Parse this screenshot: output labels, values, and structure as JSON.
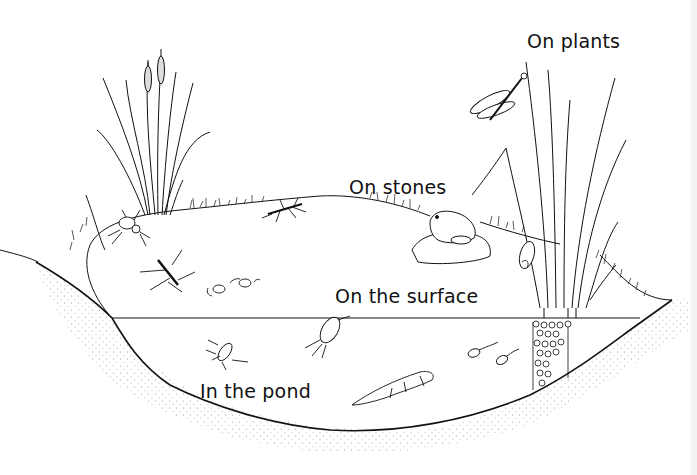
{
  "diagram": {
    "labels": [
      {
        "id": "on-plants",
        "text": "On plants",
        "x": 527,
        "y": 30
      },
      {
        "id": "on-stones",
        "text": "On stones",
        "x": 349,
        "y": 176
      },
      {
        "id": "on-the-surface",
        "text": "On the surface",
        "x": 335,
        "y": 285
      },
      {
        "id": "in-the-pond",
        "text": "In the pond",
        "x": 200,
        "y": 380
      }
    ],
    "organisms": [
      {
        "name": "bulrush",
        "habitat": "bank"
      },
      {
        "name": "reed",
        "habitat": "on-plants"
      },
      {
        "name": "damselfly",
        "habitat": "on-plants"
      },
      {
        "name": "snail",
        "habitat": "on-plants"
      },
      {
        "name": "frog",
        "habitat": "on-stones"
      },
      {
        "name": "pond-skater",
        "habitat": "on-the-surface"
      },
      {
        "name": "spider",
        "habitat": "on-the-surface"
      },
      {
        "name": "water-measurer",
        "habitat": "on-the-surface"
      },
      {
        "name": "whirligig-beetles",
        "habitat": "on-the-surface"
      },
      {
        "name": "water-boatman",
        "habitat": "in-the-pond"
      },
      {
        "name": "diving-beetle",
        "habitat": "in-the-pond"
      },
      {
        "name": "newt",
        "habitat": "in-the-pond"
      },
      {
        "name": "tadpoles",
        "habitat": "in-the-pond"
      },
      {
        "name": "frogspawn",
        "habitat": "in-the-pond"
      }
    ],
    "colors": {
      "ink": "#111111",
      "background": "#ffffff",
      "soil-dots": "#9a9a9a"
    }
  }
}
